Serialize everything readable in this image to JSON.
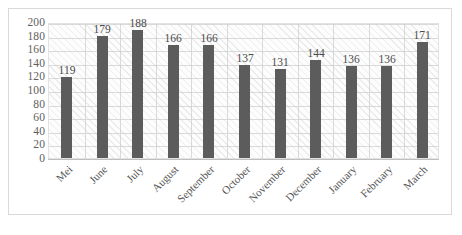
{
  "chart_data": {
    "type": "bar",
    "title": "",
    "subtitle": "",
    "xlabel": "",
    "ylabel": "",
    "categories": [
      "Mei",
      "June",
      "July",
      "August",
      "September",
      "October",
      "November",
      "December",
      "January",
      "February",
      "March"
    ],
    "values": [
      119,
      179,
      188,
      166,
      166,
      137,
      131,
      144,
      136,
      136,
      171
    ],
    "data_labels": [
      "119",
      "179",
      "188",
      "166",
      "166",
      "137",
      "131",
      "144",
      "136",
      "136",
      "171"
    ],
    "ylim": [
      0,
      200
    ],
    "ytick_step": 20,
    "ytick_labels": [
      "200",
      "180",
      "160",
      "140",
      "120",
      "100",
      "80",
      "60",
      "40",
      "20",
      "0"
    ],
    "ytick_values": [
      200,
      180,
      160,
      140,
      120,
      100,
      80,
      60,
      40,
      20,
      0
    ],
    "grid": "horizontal-and-vertical",
    "legend": "none",
    "series": [
      {
        "name": "",
        "values": [
          119,
          179,
          188,
          166,
          166,
          137,
          131,
          144,
          136,
          136,
          171
        ],
        "color": "#5c5c5c"
      }
    ],
    "bar_color": "#5c5c5c",
    "plot_background": "#fdfdfd",
    "plot_hatch": "diagonal",
    "gridline_color": "#cdcdcd",
    "axis_text_color": "#5e5e5e",
    "frame_border_color": "#d9d9d9",
    "xtick_rotation_degrees": -45
  }
}
